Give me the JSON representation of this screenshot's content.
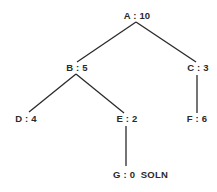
{
  "diagram": {
    "type": "search-tree",
    "nodes": [
      {
        "id": "A",
        "label": "A : 10",
        "x": 137,
        "y": 19,
        "anchor": "middle"
      },
      {
        "id": "B",
        "label": "B : 5",
        "x": 77,
        "y": 71,
        "anchor": "middle"
      },
      {
        "id": "C",
        "label": "C : 3",
        "x": 198,
        "y": 71,
        "anchor": "middle"
      },
      {
        "id": "D",
        "label": "D : 4",
        "x": 26,
        "y": 122,
        "anchor": "middle"
      },
      {
        "id": "E",
        "label": "E : 2",
        "x": 127,
        "y": 122,
        "anchor": "middle"
      },
      {
        "id": "F",
        "label": "F : 6",
        "x": 197,
        "y": 122,
        "anchor": "middle"
      },
      {
        "id": "G",
        "label": "G : 0  SOLN",
        "x": 113,
        "y": 178,
        "anchor": "start"
      }
    ],
    "edges": [
      {
        "from": "A",
        "to": "B",
        "x1": 136,
        "y1": 22,
        "x2": 77,
        "y2": 62
      },
      {
        "from": "A",
        "to": "C",
        "x1": 136,
        "y1": 22,
        "x2": 196,
        "y2": 62
      },
      {
        "from": "B",
        "to": "D",
        "x1": 76,
        "y1": 74,
        "x2": 29,
        "y2": 112
      },
      {
        "from": "B",
        "to": "E",
        "x1": 76,
        "y1": 74,
        "x2": 124,
        "y2": 113
      },
      {
        "from": "C",
        "to": "F",
        "x1": 197,
        "y1": 75,
        "x2": 197,
        "y2": 113
      },
      {
        "from": "E",
        "to": "G",
        "x1": 126,
        "y1": 126,
        "x2": 126,
        "y2": 166
      }
    ],
    "colors": {
      "line": "#2a2a2a",
      "text": "#2a2a2a",
      "background": "#ffffff"
    }
  }
}
